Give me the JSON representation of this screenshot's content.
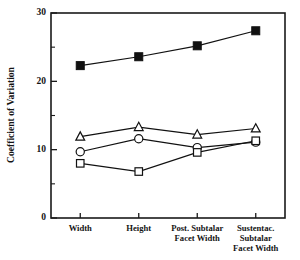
{
  "chart_data": {
    "type": "line",
    "title": "",
    "xlabel": "",
    "ylabel": "Coefficient of Variation",
    "ylim": [
      0,
      30
    ],
    "yticks": [
      0,
      10,
      20,
      30
    ],
    "ytick_labels": [
      "0",
      "10",
      "20",
      "30"
    ],
    "yminor_ticks": [
      5,
      15,
      25
    ],
    "grid": false,
    "legend": "none",
    "categories": [
      "Width",
      "Height",
      "Post. Subtalar Facet Width",
      "Sustentac. Subtalar Facet Width"
    ],
    "category_label_lines": [
      [
        "Width"
      ],
      [
        "Height"
      ],
      [
        "Post. Subtalar",
        "Facet Width"
      ],
      [
        "Sustentac.",
        "Subtalar",
        "Facet Width"
      ]
    ],
    "series": [
      {
        "name": "filled-square-series",
        "marker": "filled-square",
        "values": [
          22.3,
          23.6,
          25.2,
          27.4
        ]
      },
      {
        "name": "open-triangle-series",
        "marker": "open-triangle",
        "values": [
          11.9,
          13.3,
          12.2,
          13.1
        ]
      },
      {
        "name": "open-circle-series",
        "marker": "open-circle",
        "values": [
          9.7,
          11.6,
          10.3,
          11.1
        ]
      },
      {
        "name": "open-square-series",
        "marker": "open-square",
        "values": [
          8.0,
          6.8,
          9.6,
          11.3
        ]
      }
    ],
    "colors": {
      "axis": "#1a1a1a",
      "line": "#111111",
      "marker_fill": "#111111",
      "marker_open_fill": "#ffffff",
      "background": "#ffffff"
    }
  }
}
